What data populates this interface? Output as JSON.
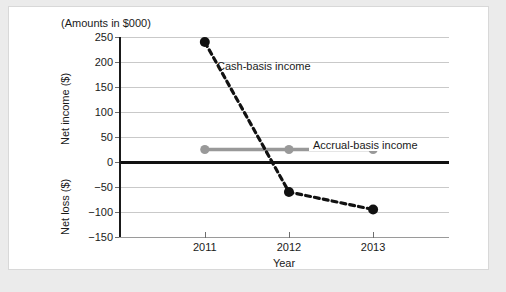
{
  "caption": "(Amounts in $000)",
  "chart_data": {
    "type": "line",
    "title": "",
    "subtitle": "(Amounts in $000)",
    "xlabel": "Year",
    "ylabel": "Net income ($) / Net loss ($)",
    "ylabel_positive": "Net income ($)",
    "ylabel_negative": "Net loss ($)",
    "categories": [
      "2011",
      "2012",
      "2013"
    ],
    "x": [
      2011,
      2012,
      2013
    ],
    "ylim": [
      -150,
      250
    ],
    "ytick_values": [
      250,
      200,
      150,
      100,
      50,
      0,
      -50,
      -100,
      -150
    ],
    "ytick_labels": [
      "250",
      "200",
      "150",
      "100",
      "50",
      "0",
      "−50",
      "−100",
      "−150"
    ],
    "grid": true,
    "legend": "annotations",
    "zero_line": true,
    "series": [
      {
        "name": "Cash-basis income",
        "values": [
          240,
          -60,
          -95
        ],
        "color": "#111111",
        "style": "dashed",
        "marker": "circle"
      },
      {
        "name": "Accrual-basis income",
        "values": [
          25,
          25,
          25
        ],
        "color": "#999999",
        "style": "solid",
        "marker": "circle"
      }
    ],
    "annotations": [
      {
        "text": "Cash-basis income",
        "series": "Cash-basis income"
      },
      {
        "text": "Accrual-basis income",
        "series": "Accrual-basis income"
      }
    ]
  }
}
